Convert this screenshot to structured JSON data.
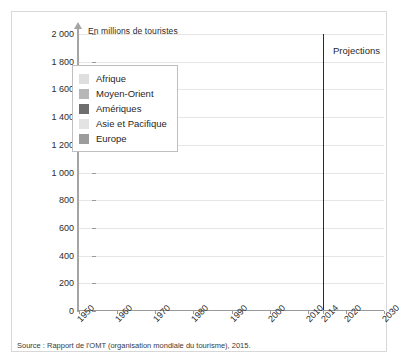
{
  "chart_data": {
    "type": "area",
    "stacked": true,
    "title": "En millions de touristes",
    "xlabel": "",
    "ylabel": "En millions de touristes",
    "ylim": [
      0,
      2000
    ],
    "xlim": [
      1950,
      2030
    ],
    "ytick_labels": [
      "2 000",
      "1 800",
      "1 600",
      "1 400",
      "1 200",
      "1 000",
      "800",
      "600",
      "400",
      "200",
      "0"
    ],
    "ytick_values": [
      2000,
      1800,
      1600,
      1400,
      1200,
      1000,
      800,
      600,
      400,
      200,
      0
    ],
    "xtick_labels": [
      "1950",
      "1960",
      "1970",
      "1980",
      "1990",
      "2000",
      "2010",
      "2014",
      "2020",
      "2030"
    ],
    "xtick_values": [
      1950,
      1960,
      1970,
      1980,
      1990,
      2000,
      2010,
      2014,
      2020,
      2030
    ],
    "grid": true,
    "legend_position": "upper-left",
    "annotations": [
      {
        "text": "Projections",
        "x": 2014,
        "note": "region right of 2014 divider line"
      }
    ],
    "divider_x": 2014,
    "stack_order_bottom_to_top": [
      "Europe",
      "Asie et Pacifique",
      "Amériques",
      "Moyen-Orient",
      "Afrique"
    ],
    "x": [
      1950,
      1955,
      1960,
      1965,
      1970,
      1975,
      1980,
      1985,
      1990,
      1995,
      2000,
      2002,
      2004,
      2006,
      2008,
      2009,
      2010,
      2012,
      2014,
      2020,
      2025,
      2030
    ],
    "series": [
      {
        "name": "Europe",
        "color": "#9c9c9c",
        "values": [
          17,
          30,
          51,
          80,
          118,
          165,
          205,
          215,
          265,
          305,
          390,
          400,
          425,
          460,
          485,
          460,
          485,
          535,
          580,
          640,
          690,
          740
        ]
      },
      {
        "name": "Asie et Pacifique",
        "color": "#e3e3e3",
        "values": [
          0.2,
          1,
          3,
          6,
          11,
          19,
          23,
          32,
          56,
          82,
          110,
          124,
          145,
          166,
          184,
          181,
          205,
          233,
          263,
          355,
          440,
          535
        ]
      },
      {
        "name": "Amériques",
        "color": "#6e6e6e",
        "values": [
          7,
          13,
          17,
          23,
          42,
          50,
          62,
          65,
          93,
          109,
          128,
          117,
          126,
          136,
          148,
          141,
          150,
          163,
          181,
          199,
          218,
          248
        ]
      },
      {
        "name": "Moyen-Orient",
        "color": "#b7b7b7",
        "values": [
          0.2,
          0.6,
          0.6,
          1,
          2,
          4,
          7,
          9,
          10,
          14,
          25,
          29,
          36,
          41,
          56,
          53,
          60,
          52,
          51,
          101,
          125,
          149
        ]
      },
      {
        "name": "Afrique",
        "color": "#dedede",
        "values": [
          0.5,
          0.8,
          1,
          1.5,
          3,
          5,
          7,
          10,
          15,
          19,
          27,
          30,
          34,
          40,
          45,
          46,
          50,
          53,
          56,
          85,
          110,
          134
        ]
      }
    ],
    "totals": [
      25,
      45,
      73,
      112,
      176,
      243,
      304,
      331,
      439,
      529,
      680,
      700,
      766,
      843,
      918,
      881,
      950,
      1036,
      1131,
      1380,
      1583,
      1806
    ],
    "legend": [
      {
        "label": "Afrique",
        "color": "#dedede"
      },
      {
        "label": "Moyen-Orient",
        "color": "#b7b7b7"
      },
      {
        "label": "Amériques",
        "color": "#6e6e6e"
      },
      {
        "label": "Asie et Pacifique",
        "color": "#e3e3e3"
      },
      {
        "label": "Europe",
        "color": "#9c9c9c"
      }
    ]
  },
  "source": {
    "text": "Source : Rapport de l'OMT (organisation mondiale du tourisme), 2015."
  },
  "colors": {
    "grid": "#e6e6e6",
    "axis": "#9a9a9a",
    "divider": "#2a2a2a",
    "text": "#1f1f1f",
    "frame": "#d8d8d8"
  }
}
